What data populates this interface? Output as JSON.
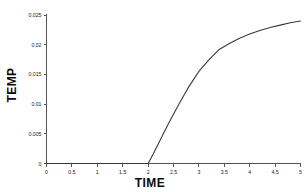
{
  "chart_data": {
    "type": "line",
    "title": "",
    "xlabel": "TIME",
    "ylabel": "TEMP",
    "xlim": [
      0,
      5
    ],
    "ylim": [
      0,
      0.025
    ],
    "grid": false,
    "legend": null,
    "line_color": "#3a3a3a",
    "axis_color": "#555555",
    "xticks": [
      "0",
      "0.5",
      "1",
      "1.5",
      "2",
      "2.5",
      "3",
      "3.5",
      "4",
      "4.5",
      "5"
    ],
    "xtick_values": [
      0,
      0.5,
      1,
      1.5,
      2,
      2.5,
      3,
      3.5,
      4,
      4.5,
      5
    ],
    "yticks": [
      "0",
      "0.005",
      "0.01",
      "0.015",
      "0.02",
      "0.025"
    ],
    "ytick_values": [
      0,
      0.005,
      0.01,
      0.015,
      0.02,
      0.025
    ],
    "series": [
      {
        "name": "TEMP",
        "x": [
          0,
          0.25,
          0.5,
          0.75,
          1,
          1.25,
          1.5,
          1.75,
          2,
          2.1,
          2.2,
          2.3,
          2.4,
          2.5,
          2.6,
          2.7,
          2.8,
          2.9,
          3,
          3.2,
          3.4,
          3.6,
          3.8,
          4,
          4.2,
          4.4,
          4.6,
          4.8,
          5
        ],
        "values": [
          0,
          0,
          0,
          0,
          0,
          0,
          0,
          0,
          0,
          0.0016,
          0.0033,
          0.005,
          0.0067,
          0.0083,
          0.0099,
          0.0114,
          0.0129,
          0.0142,
          0.0155,
          0.0175,
          0.0192,
          0.0202,
          0.0211,
          0.0218,
          0.0224,
          0.0229,
          0.0233,
          0.0237,
          0.024
        ]
      }
    ]
  },
  "axis_titles": {
    "x": "TIME",
    "y": "TEMP"
  }
}
